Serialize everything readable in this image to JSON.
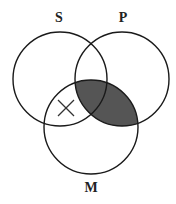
{
  "diagram": {
    "type": "venn",
    "circles": [
      {
        "id": "S",
        "label": "S",
        "cx": 60,
        "cy": 79,
        "r": 47,
        "label_x": 59,
        "label_y": 22
      },
      {
        "id": "P",
        "label": "P",
        "cx": 122,
        "cy": 79,
        "r": 47,
        "label_x": 123,
        "label_y": 22
      },
      {
        "id": "M",
        "label": "M",
        "cx": 91,
        "cy": 127,
        "r": 47,
        "label_x": 91,
        "label_y": 192
      }
    ],
    "shaded_region": "P ∩ M",
    "shade_color": "#555555",
    "x_mark": {
      "region": "S ∩ M − P",
      "x": 66,
      "y": 108,
      "size": 8
    },
    "stroke_color": "#1a1a1a"
  }
}
